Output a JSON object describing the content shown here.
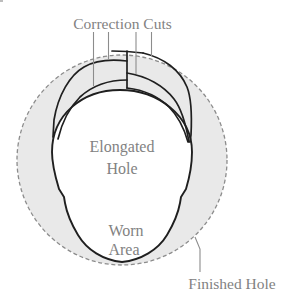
{
  "figure": {
    "type": "scanned-technical-diagram",
    "labels": {
      "correction_cuts": "Correction Cuts",
      "elongated_hole_line1": "Elongated",
      "elongated_hole_line2": "Hole",
      "worn_area_line1": "Worn",
      "worn_area_line2": "Area",
      "finished_hole": "Finished Hole"
    },
    "colors": {
      "background": "#ffffff",
      "ring_fill": "#e9e9e9",
      "hole_fill": "#ffffff",
      "solid_stroke": "#1f1f1f",
      "dashed_stroke": "#8c8c8c",
      "leader_line": "#8c8c8c",
      "label_text": "#828282",
      "artifact": "#bdbdbd"
    }
  }
}
